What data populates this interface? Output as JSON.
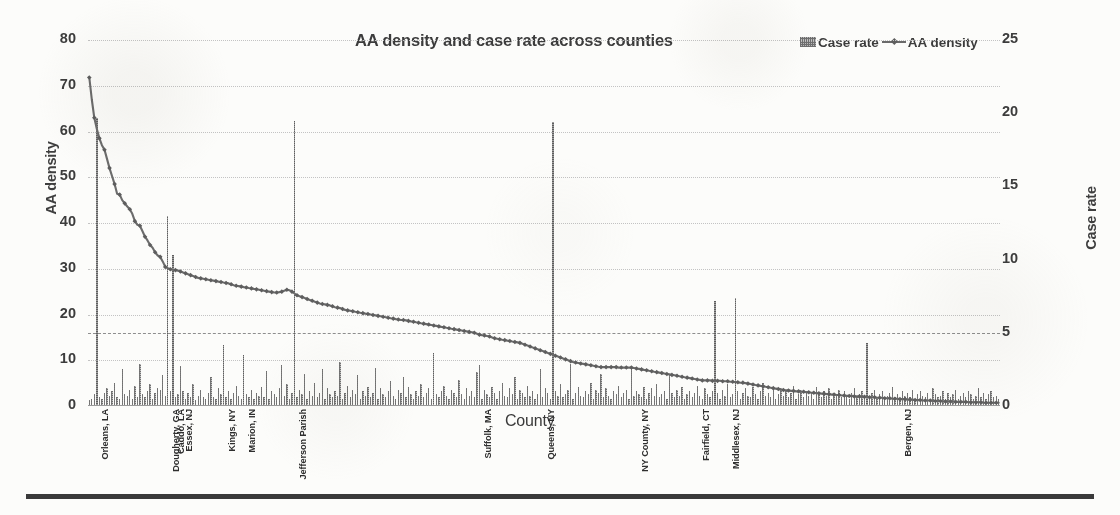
{
  "chart_data": {
    "type": "bar",
    "title": "AA density and case rate across counties",
    "xlabel": "County",
    "ylabel": "AA density",
    "y2label": "Case rate",
    "ylim": [
      0,
      80
    ],
    "y2lim": [
      0,
      25
    ],
    "yticks": [
      "0",
      "10",
      "20",
      "30",
      "40",
      "50",
      "60",
      "70",
      "80"
    ],
    "y2ticks": [
      "0",
      "5",
      "10",
      "15",
      "20",
      "25"
    ],
    "grid": "horizontal dotted",
    "legend_position": "top-right",
    "reference_line": {
      "axis": "Case rate",
      "value": 5,
      "style": "dashed"
    },
    "legend": [
      {
        "name": "Case rate",
        "marker": "bar"
      },
      {
        "name": "AA density",
        "marker": "line"
      }
    ],
    "categories_labeled": [
      {
        "label": "Orleans, LA",
        "index": 3
      },
      {
        "label": "Dougherty, GA",
        "index": 31
      },
      {
        "label": "Caddo, LA",
        "index": 33
      },
      {
        "label": "Essex, NJ",
        "index": 36
      },
      {
        "label": "Kings, NY",
        "index": 53
      },
      {
        "label": "Marion, IN",
        "index": 61
      },
      {
        "label": "Jefferson Parish",
        "index": 81
      },
      {
        "label": "Suffolk, MA",
        "index": 154
      },
      {
        "label": "Queens, NY",
        "index": 179
      },
      {
        "label": "NY County, NY",
        "index": 216
      },
      {
        "label": "Fairfield, CT",
        "index": 240
      },
      {
        "label": "Middlesex, NJ",
        "index": 252
      },
      {
        "label": "Bergen, NJ",
        "index": 320
      }
    ],
    "series": [
      {
        "name": "AA density",
        "axis": "left",
        "type": "line",
        "values": [
          71.8,
          67.0,
          63.0,
          60.5,
          58.5,
          57.0,
          56.0,
          54.0,
          52.0,
          50.2,
          48.5,
          46.4,
          46.2,
          45.0,
          44.3,
          43.6,
          43.0,
          42.0,
          40.4,
          39.6,
          39.4,
          38.2,
          37.0,
          36.2,
          35.2,
          34.6,
          33.6,
          32.9,
          32.6,
          31.6,
          30.4,
          30.1,
          29.9,
          29.8,
          29.7,
          29.6,
          29.4,
          29.2,
          29.0,
          28.8,
          28.6,
          28.4,
          28.2,
          28.0,
          27.9,
          27.8,
          27.7,
          27.6,
          27.5,
          27.4,
          27.3,
          27.2,
          27.1,
          27.0,
          26.9,
          26.8,
          26.6,
          26.4,
          26.3,
          26.2,
          26.1,
          26.0,
          25.9,
          25.8,
          25.7,
          25.6,
          25.5,
          25.4,
          25.3,
          25.2,
          25.1,
          25.0,
          24.9,
          24.8,
          24.8,
          24.9,
          25.0,
          25.2,
          25.4,
          25.3,
          25.0,
          24.6,
          24.2,
          24.0,
          23.8,
          23.6,
          23.4,
          23.2,
          23.0,
          22.8,
          22.6,
          22.4,
          22.3,
          22.2,
          22.1,
          22.0,
          21.8,
          21.6,
          21.5,
          21.4,
          21.2,
          21.0,
          20.9,
          20.8,
          20.7,
          20.6,
          20.5,
          20.4,
          20.3,
          20.2,
          20.1,
          20.0,
          19.9,
          19.8,
          19.7,
          19.6,
          19.5,
          19.4,
          19.3,
          19.2,
          19.1,
          19.0,
          18.9,
          18.8,
          18.8,
          18.7,
          18.6,
          18.5,
          18.4,
          18.3,
          18.2,
          18.1,
          18.0,
          17.9,
          17.8,
          17.7,
          17.6,
          17.5,
          17.4,
          17.3,
          17.2,
          17.1,
          17.0,
          16.9,
          16.8,
          16.7,
          16.6,
          16.5,
          16.4,
          16.3,
          16.2,
          16.1,
          16.0,
          15.8,
          15.6,
          15.5,
          15.4,
          15.3,
          15.2,
          15.0,
          14.8,
          14.7,
          14.6,
          14.5,
          14.4,
          14.3,
          14.2,
          14.1,
          14.0,
          13.9,
          13.8,
          13.6,
          13.4,
          13.2,
          13.0,
          12.8,
          12.6,
          12.4,
          12.2,
          12.0,
          11.8,
          11.6,
          11.4,
          11.2,
          11.0,
          10.8,
          10.6,
          10.4,
          10.2,
          10.0,
          9.8,
          9.6,
          9.5,
          9.4,
          9.3,
          9.2,
          9.1,
          9.0,
          8.9,
          8.8,
          8.7,
          8.6,
          8.5,
          8.5,
          8.5,
          8.5,
          8.5,
          8.5,
          8.5,
          8.4,
          8.4,
          8.4,
          8.4,
          8.4,
          8.4,
          8.3,
          8.2,
          8.1,
          8.0,
          7.9,
          7.8,
          7.7,
          7.6,
          7.5,
          7.4,
          7.3,
          7.2,
          7.1,
          7.0,
          6.9,
          6.8,
          6.7,
          6.6,
          6.5,
          6.4,
          6.3,
          6.2,
          6.1,
          6.0,
          5.9,
          5.8,
          5.7,
          5.6,
          5.6,
          5.6,
          5.6,
          5.5,
          5.5,
          5.5,
          5.5,
          5.4,
          5.4,
          5.4,
          5.3,
          5.3,
          5.2,
          5.2,
          5.1,
          5.1,
          5.0,
          4.9,
          4.8,
          4.7,
          4.6,
          4.5,
          4.4,
          4.3,
          4.2,
          4.1,
          4.0,
          3.9,
          3.8,
          3.7,
          3.6,
          3.5,
          3.4,
          3.4,
          3.3,
          3.3,
          3.2,
          3.2,
          3.1,
          3.1,
          3.0,
          3.0,
          2.9,
          2.9,
          2.8,
          2.8,
          2.7,
          2.7,
          2.6,
          2.6,
          2.5,
          2.5,
          2.4,
          2.4,
          2.3,
          2.3,
          2.2,
          2.2,
          2.2,
          2.1,
          2.1,
          2.1,
          2.0,
          2.0,
          2.0,
          1.9,
          1.9,
          1.9,
          1.8,
          1.8,
          1.8,
          1.7,
          1.7,
          1.7,
          1.6,
          1.6,
          1.6,
          1.5,
          1.5,
          1.5,
          1.4,
          1.4,
          1.4,
          1.3,
          1.3,
          1.3,
          1.2,
          1.2,
          1.2,
          1.2,
          1.1,
          1.1,
          1.1,
          1.1,
          1.0,
          1.0,
          1.0,
          1.0,
          1.0,
          0.9,
          0.9,
          0.9,
          0.9,
          0.9,
          0.8,
          0.8,
          0.8,
          0.8,
          0.8,
          0.8,
          0.7,
          0.7,
          0.7,
          0.7,
          0.7,
          0.7,
          0.7
        ]
      },
      {
        "name": "Case rate",
        "axis": "right",
        "type": "bar",
        "values": [
          0.4,
          0.5,
          0.8,
          19.7,
          0.6,
          0.5,
          0.9,
          1.2,
          0.7,
          1.0,
          1.6,
          0.6,
          0.5,
          2.5,
          0.8,
          0.7,
          1.1,
          0.5,
          1.4,
          0.6,
          2.9,
          0.8,
          0.6,
          1.0,
          1.5,
          0.5,
          0.9,
          1.2,
          1.1,
          2.1,
          0.7,
          13.0,
          1.0,
          10.3,
          0.6,
          0.8,
          2.7,
          1.0,
          0.5,
          0.9,
          0.6,
          1.5,
          0.4,
          0.7,
          1.1,
          0.6,
          0.5,
          0.9,
          2.0,
          0.6,
          0.5,
          1.2,
          0.8,
          4.2,
          0.6,
          1.0,
          0.5,
          0.9,
          1.4,
          0.7,
          0.5,
          3.5,
          0.8,
          0.6,
          1.1,
          0.5,
          0.9,
          0.7,
          1.3,
          0.6,
          2.4,
          0.5,
          1.0,
          0.8,
          0.6,
          1.2,
          2.8,
          0.7,
          1.5,
          0.5,
          0.9,
          19.5,
          0.6,
          1.1,
          0.8,
          2.2,
          0.5,
          1.0,
          0.7,
          1.6,
          0.6,
          0.9,
          2.5,
          0.5,
          1.2,
          0.8,
          0.6,
          1.0,
          0.7,
          3.0,
          0.5,
          0.9,
          1.4,
          0.6,
          1.1,
          0.8,
          2.1,
          0.5,
          1.0,
          0.7,
          1.3,
          0.6,
          0.9,
          2.6,
          0.5,
          1.2,
          0.8,
          0.6,
          1.0,
          1.7,
          0.7,
          0.5,
          1.1,
          0.9,
          2.0,
          0.6,
          1.3,
          0.8,
          0.5,
          1.0,
          0.7,
          1.5,
          0.6,
          0.9,
          1.2,
          0.5,
          3.6,
          0.8,
          0.6,
          1.0,
          1.4,
          0.7,
          0.5,
          1.1,
          0.9,
          0.6,
          1.8,
          0.8,
          0.5,
          1.2,
          0.7,
          1.0,
          0.6,
          2.3,
          2.8,
          0.5,
          1.1,
          0.8,
          0.6,
          1.3,
          0.9,
          0.5,
          1.0,
          1.6,
          0.7,
          0.6,
          1.2,
          0.8,
          2.0,
          0.5,
          1.1,
          0.9,
          0.6,
          1.4,
          0.7,
          1.0,
          0.5,
          0.8,
          2.5,
          0.6,
          1.2,
          0.9,
          0.5,
          19.4,
          1.0,
          0.7,
          1.5,
          0.6,
          0.8,
          1.1,
          2.9,
          0.5,
          0.9,
          1.3,
          0.7,
          0.6,
          1.0,
          0.8,
          1.6,
          0.5,
          1.1,
          0.9,
          2.2,
          0.6,
          1.2,
          0.7,
          0.5,
          1.0,
          0.8,
          1.4,
          0.6,
          0.9,
          1.1,
          0.5,
          2.6,
          0.7,
          1.0,
          0.8,
          0.6,
          1.3,
          0.5,
          0.9,
          1.2,
          0.7,
          1.5,
          0.6,
          0.8,
          1.0,
          0.5,
          2.1,
          0.9,
          0.6,
          1.1,
          0.7,
          1.3,
          0.5,
          0.8,
          1.0,
          0.6,
          0.9,
          1.4,
          0.7,
          0.5,
          1.2,
          0.8,
          0.6,
          1.0,
          7.2,
          0.9,
          0.5,
          1.1,
          0.7,
          1.5,
          0.6,
          0.8,
          7.4,
          1.0,
          0.5,
          0.9,
          1.2,
          0.7,
          0.6,
          1.3,
          0.8,
          0.5,
          1.0,
          1.6,
          0.7,
          0.9,
          0.6,
          1.1,
          0.5,
          0.8,
          1.2,
          0.7,
          1.0,
          0.6,
          0.9,
          1.4,
          0.5,
          0.8,
          1.1,
          0.6,
          1.0,
          0.7,
          0.9,
          0.5,
          1.3,
          0.8,
          0.6,
          1.0,
          0.7,
          1.2,
          0.5,
          0.9,
          0.8,
          1.1,
          0.6,
          1.0,
          0.7,
          0.5,
          0.9,
          1.2,
          0.6,
          0.8,
          1.0,
          0.7,
          4.3,
          0.5,
          0.9,
          1.1,
          0.6,
          0.8,
          1.0,
          0.5,
          0.7,
          0.9,
          1.3,
          0.6,
          0.8,
          0.5,
          1.0,
          0.7,
          0.9,
          0.6,
          1.1,
          0.5,
          0.8,
          1.0,
          0.7,
          0.6,
          0.9,
          0.5,
          1.2,
          0.8,
          0.6,
          0.7,
          1.0,
          0.5,
          0.9,
          0.6,
          0.8,
          1.1,
          0.5,
          0.7,
          0.9,
          0.6,
          1.0,
          0.8,
          0.5,
          0.7,
          1.2,
          0.6,
          0.9,
          0.5,
          0.8,
          1.0,
          0.6,
          0.7,
          0.5
        ]
      }
    ]
  }
}
